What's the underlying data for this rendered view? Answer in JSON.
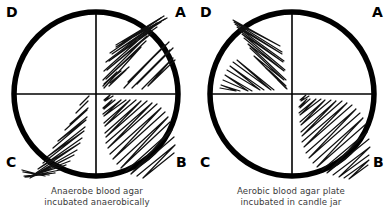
{
  "figure": {
    "background_color": "#ffffff",
    "ink_color": "#000000",
    "caption_color": "#3a3a3a"
  },
  "plates": [
    {
      "id": "anaerobe-plate",
      "name": "Anaerobe blood agar plate",
      "caption_lines": [
        "Anaerobe blood agar",
        "incubated anaerobically"
      ],
      "quadrant_labels": {
        "top_left": "D",
        "top_right": "A",
        "bottom_left": "C",
        "bottom_right": "B"
      },
      "quadrants": [
        {
          "label": "A",
          "position": "top-right",
          "growth": "heavy streaks"
        },
        {
          "label": "B",
          "position": "bottom-right",
          "growth": "heavy streaks"
        },
        {
          "label": "C",
          "position": "bottom-left",
          "growth": "heavy streaks"
        },
        {
          "label": "D",
          "position": "top-left",
          "growth": "no growth"
        }
      ]
    },
    {
      "id": "aerobic-plate",
      "name": "Aerobic blood agar plate",
      "caption_lines": [
        "Aerobic blood agar plate",
        "incubated in candle jar"
      ],
      "quadrant_labels": {
        "top_left": "D",
        "top_right": "A",
        "bottom_left": "C",
        "bottom_right": "B"
      },
      "quadrants": [
        {
          "label": "A",
          "position": "top-right",
          "growth": "no growth"
        },
        {
          "label": "B",
          "position": "bottom-right",
          "growth": "heavy streaks"
        },
        {
          "label": "C",
          "position": "bottom-left",
          "growth": "no growth"
        },
        {
          "label": "D",
          "position": "top-left",
          "growth": "heavy streaks"
        }
      ]
    }
  ]
}
